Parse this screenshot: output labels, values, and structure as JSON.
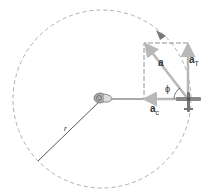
{
  "diagram": {
    "labels": {
      "radius": "r",
      "total_accel": "a",
      "tangential_accel": "a",
      "tangential_sub": "T",
      "centripetal_accel": "a",
      "centripetal_sub": "c",
      "angle": "ϕ"
    },
    "colors": {
      "circle": "#9a9a9a",
      "vector": "#b8b8b8",
      "radius_line": "#444444",
      "text": "#333333"
    },
    "geometry": {
      "center": [
        102,
        99
      ],
      "radius": 89,
      "plane": [
        188,
        99
      ]
    }
  }
}
